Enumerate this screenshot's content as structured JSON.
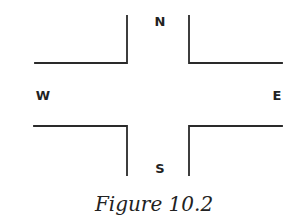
{
  "diagram": {
    "type": "intersection",
    "line_color": "#2a2a2a",
    "directions": {
      "north": "N",
      "south": "S",
      "west": "W",
      "east": "E"
    },
    "caption": "Figure 10.2"
  }
}
